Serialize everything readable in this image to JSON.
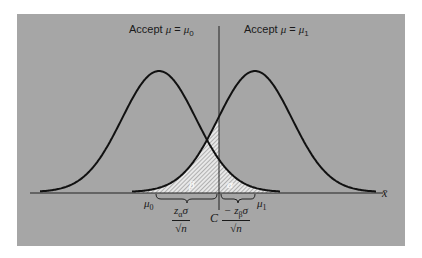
{
  "figure": {
    "region_labels": {
      "left": {
        "prefix": "Accept ",
        "mu": "μ",
        "eq": " = ",
        "rhs": "μ",
        "rhs_sub": "0"
      },
      "right": {
        "prefix": "Accept ",
        "mu": "μ",
        "eq": " = ",
        "rhs": "μ",
        "rhs_sub": "1"
      }
    },
    "axis_label": "x̄",
    "area_labels": {
      "beta": "β",
      "alpha": "α"
    },
    "tick_labels": {
      "mu0": {
        "base": "μ",
        "sub": "0"
      },
      "mu1": {
        "base": "μ",
        "sub": "1"
      },
      "critical": "C"
    },
    "brace_labels": {
      "left": {
        "numerator": "z",
        "numerator_sub": "α",
        "numerator_tail": "σ",
        "denominator": "√n"
      },
      "right": {
        "numerator": "− z",
        "numerator_sub": "β",
        "numerator_tail": "σ",
        "denominator": "√n"
      }
    },
    "colors": {
      "background": "#a6a6a6",
      "curve": "#111111",
      "hatch_fill": "#e8e8e8",
      "hatch_line": "#8a8a8a"
    }
  },
  "chart_data": {
    "type": "line",
    "title": "",
    "xlabel": "x̄",
    "ylabel": "",
    "series": [
      {
        "name": "Sampling distribution under H0 (μ = μ0)",
        "distribution": "normal",
        "mean_label": "μ0"
      },
      {
        "name": "Sampling distribution under H1 (μ = μ1)",
        "distribution": "normal",
        "mean_label": "μ1"
      }
    ],
    "critical_value_label": "C",
    "shaded_regions": [
      {
        "label": "β",
        "description": "area under μ1 curve left of C"
      },
      {
        "label": "α",
        "description": "area under μ0 curve right of C"
      }
    ],
    "annotations": [
      "Accept μ = μ0",
      "Accept μ = μ1",
      "zα σ / √n",
      "−zβ σ / √n"
    ]
  }
}
